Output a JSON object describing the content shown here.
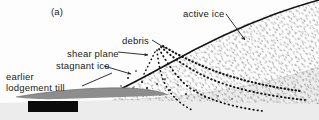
{
  "figure": {
    "panel_letter": "(a)",
    "type": "geological cross-section diagram",
    "background_color": "#fdfdfd",
    "ink_color": "#1a1a1a",
    "till_color": "#8a8a8a",
    "basal_layer_color": "#ebebeb"
  },
  "labels": {
    "active_ice": "active ice",
    "debris": "debris",
    "shear_plane": "shear plane",
    "stagnant_ice": "stagnant ice",
    "earlier_lodgement_till": "earlier\nlodgement till"
  },
  "annotations": {
    "active_ice_leader": "arrow pointing down-right into stippled active ice body",
    "debris_leader": "short line down-right to debris band convergence",
    "shear_plane_leader": "dashed line with arrowhead pointing right to shear plane",
    "stagnant_ice_leader": "line with arrowhead pointing right into stagnant ice wedge",
    "earlier_till_leader": "line down-right to grey till lens"
  },
  "scale_bar": {
    "present": true,
    "appearance": "solid black rectangle (obscured scale bar)",
    "color": "#0b0b0b",
    "caption": ""
  },
  "features": {
    "ice_surface": "curved line rising from lower-left to upper-right",
    "debris_bands": "three dotted arcuate bands fanning down-right from convergence point",
    "ice_stipple": "fine random dash texture filling the ice body",
    "till_lens": "grey tapering lens at base, left of centre",
    "basal_ground": "light grey layer curving upward to the right"
  }
}
